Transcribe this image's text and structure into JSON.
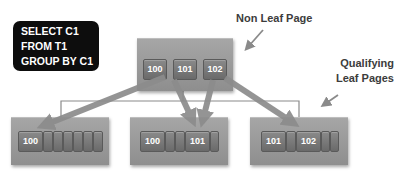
{
  "query": {
    "lines": [
      "SELECT C1",
      "FROM T1",
      "GROUP BY C1"
    ]
  },
  "labels": {
    "non_leaf": "Non Leaf Page",
    "qualifying_line1": "Qualifying",
    "qualifying_line2": "Leaf Pages"
  },
  "non_leaf_page": {
    "keys": [
      "100",
      "101",
      "102"
    ]
  },
  "leaf_pages": [
    {
      "keys": [
        "100"
      ],
      "empty_slots": 6
    },
    {
      "keys": [
        "100",
        "101"
      ],
      "empty_slots": 2
    },
    {
      "keys": [
        "101",
        "102"
      ],
      "empty_slots": 2
    }
  ],
  "colors": {
    "page_fill": "#999999",
    "slot_fill": "#777777",
    "query_box": "#0d0d0d",
    "arrow": "#8c8c8c"
  }
}
